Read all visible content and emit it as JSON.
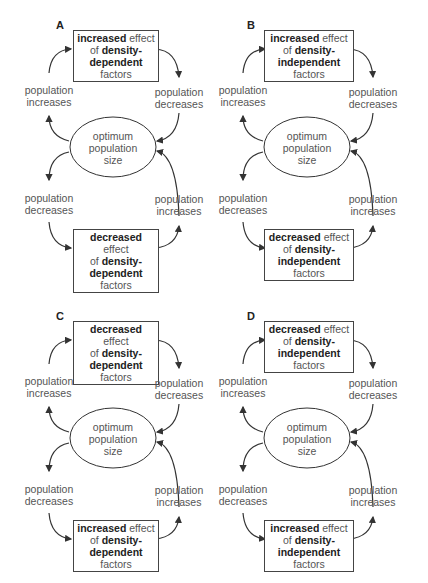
{
  "panels": [
    {
      "letter": "A",
      "top_box": {
        "strength": "increased",
        "mid": " effect",
        "of": "of ",
        "factor": "density-",
        "type": "dependent",
        "tail": " factors"
      },
      "bottom_box": {
        "strength": "decreased",
        "mid": " effect",
        "of": "of ",
        "factor": "density-",
        "type": "dependent",
        "tail": " factors"
      },
      "upper_left": {
        "line1": "population",
        "line2": "increases"
      },
      "upper_right": {
        "line1": "population",
        "line2": "decreases"
      },
      "lower_left": {
        "line1": "population",
        "line2": "decreases"
      },
      "lower_right": {
        "line1": "population",
        "line2": "increases"
      },
      "center": {
        "line1": "optimum",
        "line2": "population",
        "line3": "size"
      }
    },
    {
      "letter": "B",
      "top_box": {
        "strength": "increased",
        "mid": " effect",
        "of": "of ",
        "factor": "density-",
        "type": "independent",
        "tail": " factors"
      },
      "bottom_box": {
        "strength": "decreased",
        "mid": " effect",
        "of": "of ",
        "factor": "density-",
        "type": "independent",
        "tail": " factors"
      },
      "upper_left": {
        "line1": "population",
        "line2": "increases"
      },
      "upper_right": {
        "line1": "population",
        "line2": "decreases"
      },
      "lower_left": {
        "line1": "population",
        "line2": "decreases"
      },
      "lower_right": {
        "line1": "population",
        "line2": "increases"
      },
      "center": {
        "line1": "optimum",
        "line2": "population",
        "line3": "size"
      }
    },
    {
      "letter": "C",
      "top_box": {
        "strength": "decreased",
        "mid": " effect",
        "of": "of ",
        "factor": "density-",
        "type": "dependent",
        "tail": " factors"
      },
      "bottom_box": {
        "strength": "increased",
        "mid": " effect",
        "of": "of ",
        "factor": "density-",
        "type": "dependent",
        "tail": " factors"
      },
      "upper_left": {
        "line1": "population",
        "line2": "increases"
      },
      "upper_right": {
        "line1": "population",
        "line2": "decreases"
      },
      "lower_left": {
        "line1": "population",
        "line2": "decreases"
      },
      "lower_right": {
        "line1": "population",
        "line2": "increases"
      },
      "center": {
        "line1": "optimum",
        "line2": "population",
        "line3": "size"
      }
    },
    {
      "letter": "D",
      "top_box": {
        "strength": "decreased",
        "mid": " effect",
        "of": "of ",
        "factor": "density-",
        "type": "independent",
        "tail": " factors"
      },
      "bottom_box": {
        "strength": "increased",
        "mid": " effect",
        "of": "of ",
        "factor": "density-",
        "type": "independent",
        "tail": " factors"
      },
      "upper_left": {
        "line1": "population",
        "line2": "increases"
      },
      "upper_right": {
        "line1": "population",
        "line2": "decreases"
      },
      "lower_left": {
        "line1": "population",
        "line2": "decreases"
      },
      "lower_right": {
        "line1": "population",
        "line2": "increases"
      },
      "center": {
        "line1": "optimum",
        "line2": "population",
        "line3": "size"
      }
    }
  ]
}
